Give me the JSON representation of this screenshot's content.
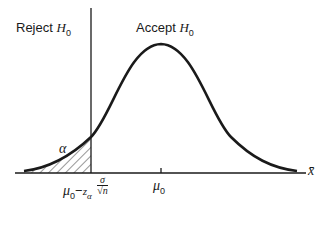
{
  "labels": {
    "reject_prefix": "Reject",
    "accept_prefix": "Accept",
    "hypothesis_symbol": "H",
    "hypothesis_sub": "0",
    "alpha": "α",
    "mu": "μ",
    "mu_sub": "0",
    "critical_minus": "−",
    "critical_z": "z",
    "critical_z_sub": "α",
    "critical_sigma": "σ",
    "critical_sqrt_n": "√n",
    "x_axis": "x̄"
  },
  "colors": {
    "ink": "#1a1a1a",
    "background": "#ffffff"
  }
}
